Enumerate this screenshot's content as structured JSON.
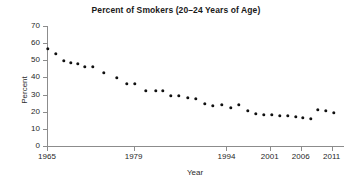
{
  "chart_data": {
    "type": "scatter",
    "title": "Percent of Smokers (20–24 Years of Age)",
    "xlabel": "Year",
    "ylabel": "Percent",
    "grid": false,
    "legend": null,
    "xlim": [
      1965,
      2013
    ],
    "ylim": [
      0,
      70
    ],
    "ytick_labels": [
      "70",
      "60",
      "50",
      "40",
      "30",
      "20",
      "10",
      "0"
    ],
    "ytick_values": [
      70,
      60,
      50,
      40,
      30,
      20,
      10,
      0
    ],
    "xtick_labels": [
      "1965",
      "1979",
      "1994",
      "2001",
      "2006",
      "2011"
    ],
    "xtick_values": [
      1965,
      1979,
      1994,
      2001,
      2006,
      2011
    ],
    "marker_color": "#111111",
    "axis_color": "#8c8c8c",
    "background_color": "#ffffff",
    "x": [
      1965,
      1966,
      1967,
      1968,
      1969,
      1970,
      1971,
      1974,
      1979,
      1983,
      1985,
      1987,
      1988,
      1990,
      1991,
      1992,
      1993,
      1994,
      1995,
      1997,
      1998,
      1999,
      2000,
      2001,
      2002,
      2003,
      2004,
      2005,
      2006,
      2007,
      2008,
      2009,
      2010,
      2011,
      2012
    ],
    "values": [
      59.5,
      56.5,
      52.5,
      51.5,
      50.5,
      49.0,
      49.0,
      45.5,
      43.0,
      39.5,
      39.5,
      35.0,
      35.0,
      35.0,
      32.5,
      32.5,
      31.5,
      30.5,
      28.0,
      26.5,
      27.0,
      25.5,
      27.0,
      23.5,
      22.0,
      21.0,
      21.0,
      20.5,
      20.5,
      20.0,
      19.5,
      19.0,
      18.5,
      18.0,
      17.5
    ],
    "points": [
      {
        "year": 1965,
        "percent": 59.5
      },
      {
        "year": 1966,
        "percent": 56.5
      },
      {
        "year": 1967,
        "percent": 52.5
      },
      {
        "year": 1968,
        "percent": 51.5
      },
      {
        "year": 1969,
        "percent": 50.5
      },
      {
        "year": 1970,
        "percent": 49.0
      },
      {
        "year": 1971,
        "percent": 49.0
      },
      {
        "year": 1972,
        "percent": 45.5
      },
      {
        "year": 1973,
        "percent": 43.0
      },
      {
        "year": 1974,
        "percent": 39.5
      },
      {
        "year": 1975,
        "percent": 39.5
      },
      {
        "year": 1976,
        "percent": 35.0
      },
      {
        "year": 1977,
        "percent": 35.0
      },
      {
        "year": 1978,
        "percent": 35.0
      },
      {
        "year": 1979,
        "percent": 32.5
      },
      {
        "year": 1980,
        "percent": 32.5
      },
      {
        "year": 1981,
        "percent": 31.5
      },
      {
        "year": 1982,
        "percent": 30.5
      },
      {
        "year": 1983,
        "percent": 28.0
      },
      {
        "year": 1984,
        "percent": 26.5
      },
      {
        "year": 1985,
        "percent": 27.0
      },
      {
        "year": 1986,
        "percent": 25.5
      },
      {
        "year": 1987,
        "percent": 27.0
      },
      {
        "year": 1988,
        "percent": 23.5
      },
      {
        "year": 1989,
        "percent": 22.0
      },
      {
        "year": 1990,
        "percent": 21.0
      }
    ]
  },
  "plot_geometry": {
    "x_pixels": [
      48,
      56,
      64,
      71,
      78,
      85,
      93,
      104,
      117,
      127,
      135,
      146,
      156,
      163,
      171,
      179,
      188,
      196,
      205,
      213,
      222,
      231,
      239,
      248,
      256,
      264,
      272,
      280,
      288,
      296,
      303,
      311,
      318,
      326,
      334
    ],
    "y_pixels": [
      49,
      54,
      61,
      63,
      64,
      67,
      67,
      73,
      78,
      84,
      84,
      91,
      91,
      91,
      96,
      96,
      98,
      99,
      104,
      106,
      105,
      108,
      105,
      111,
      114,
      115,
      115,
      116,
      116,
      117,
      118,
      119,
      110,
      111,
      113
    ]
  }
}
